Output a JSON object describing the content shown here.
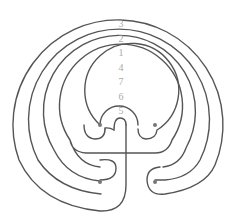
{
  "diagram": {
    "type": "seven-circuit classical labyrinth",
    "circuit_labels": [
      "3",
      "2",
      "1",
      "4",
      "7",
      "6",
      "5"
    ],
    "line_color": "#555555",
    "label_color": "#aaaaaa",
    "background": "#ffffff"
  }
}
